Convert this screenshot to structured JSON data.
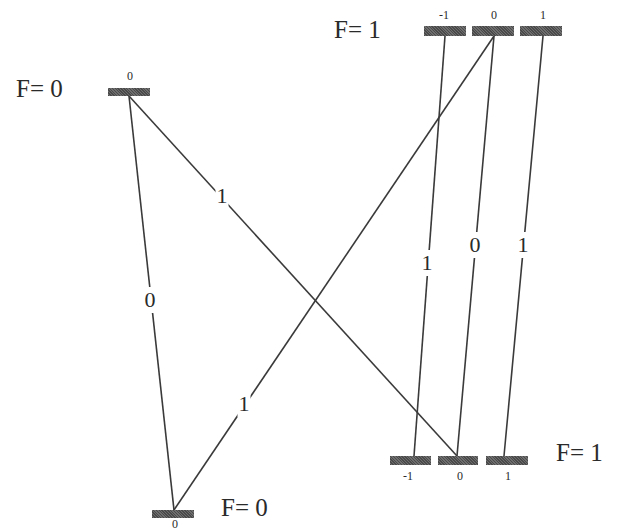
{
  "diagram": {
    "type": "hyperfine transition diagram",
    "colors": {
      "line": "#3a3a3a",
      "bar": "#5a5a5a",
      "text": "#2a2a2a",
      "background": "#ffffff"
    },
    "levels": [
      {
        "id": "upper-f0",
        "label": "F= 0",
        "label_x": 16,
        "label_y": 76,
        "sublevels": [
          {
            "m": "0",
            "x": 108,
            "y": 88,
            "w": 42,
            "h": 8,
            "tx": 130,
            "ty": 70
          }
        ]
      },
      {
        "id": "upper-f1",
        "label": "F= 1",
        "label_x": 334,
        "label_y": 17,
        "sublevels": [
          {
            "m": "-1",
            "x": 424,
            "y": 26,
            "w": 42,
            "h": 10,
            "tx": 444,
            "ty": 9
          },
          {
            "m": "0",
            "x": 472,
            "y": 26,
            "w": 42,
            "h": 10,
            "tx": 494,
            "ty": 9
          },
          {
            "m": "1",
            "x": 520,
            "y": 26,
            "w": 42,
            "h": 10,
            "tx": 543,
            "ty": 9
          }
        ]
      },
      {
        "id": "lower-f1",
        "label": "F= 1",
        "label_x": 556,
        "label_y": 440,
        "sublevels": [
          {
            "m": "-1",
            "x": 390,
            "y": 456,
            "w": 41,
            "h": 9,
            "tx": 408,
            "ty": 470
          },
          {
            "m": "0",
            "x": 438,
            "y": 456,
            "w": 40,
            "h": 9,
            "tx": 460,
            "ty": 470
          },
          {
            "m": "1",
            "x": 486,
            "y": 456,
            "w": 42,
            "h": 9,
            "tx": 508,
            "ty": 470
          }
        ]
      },
      {
        "id": "lower-f0",
        "label": "F= 0",
        "label_x": 221,
        "label_y": 495,
        "sublevels": [
          {
            "m": "0",
            "x": 152,
            "y": 510,
            "w": 42,
            "h": 8,
            "tx": 175,
            "ty": 518
          }
        ]
      }
    ],
    "transitions": [
      {
        "from": "upper-f0 m=0",
        "to": "lower-f0 m=0",
        "x1": 129,
        "y1": 96,
        "x2": 174,
        "y2": 510,
        "label": "0",
        "lx": 150,
        "ly": 300
      },
      {
        "from": "upper-f0 m=0",
        "to": "lower-f1 m=0",
        "x1": 129,
        "y1": 96,
        "x2": 457,
        "y2": 456,
        "label": "1",
        "lx": 222,
        "ly": 196
      },
      {
        "from": "upper-f1 m=0",
        "to": "lower-f0 m=0",
        "x1": 494,
        "y1": 36,
        "x2": 174,
        "y2": 510,
        "label": "1",
        "lx": 244,
        "ly": 404
      },
      {
        "from": "upper-f1 m=-1",
        "to": "lower-f1 m=-1",
        "x1": 445,
        "y1": 36,
        "x2": 414,
        "y2": 456,
        "label": "1",
        "lx": 427,
        "ly": 263
      },
      {
        "from": "upper-f1 m=0",
        "to": "lower-f1 m=0",
        "x1": 494,
        "y1": 36,
        "x2": 457,
        "y2": 456,
        "label": "0",
        "lx": 475,
        "ly": 245
      },
      {
        "from": "upper-f1 m=1",
        "to": "lower-f1 m=1",
        "x1": 543,
        "y1": 36,
        "x2": 504,
        "y2": 456,
        "label": "1",
        "lx": 523,
        "ly": 245
      }
    ]
  }
}
